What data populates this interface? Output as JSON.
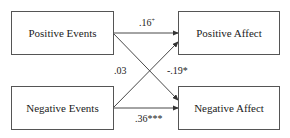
{
  "nodes": {
    "positive_events": {
      "label": "Positive Events"
    },
    "negative_events": {
      "label": "Negative Events"
    },
    "positive_affect": {
      "label": "Positive Affect"
    },
    "negative_affect": {
      "label": "Negative Affect"
    }
  },
  "paths": {
    "pe_to_pa": {
      "value": ".16",
      "sig": "+"
    },
    "pe_to_na": {
      "value": "-.19",
      "sig": "*"
    },
    "ne_to_pa": {
      "value": ".03",
      "sig": ""
    },
    "ne_to_na": {
      "value": ".36",
      "sig": "***"
    }
  }
}
